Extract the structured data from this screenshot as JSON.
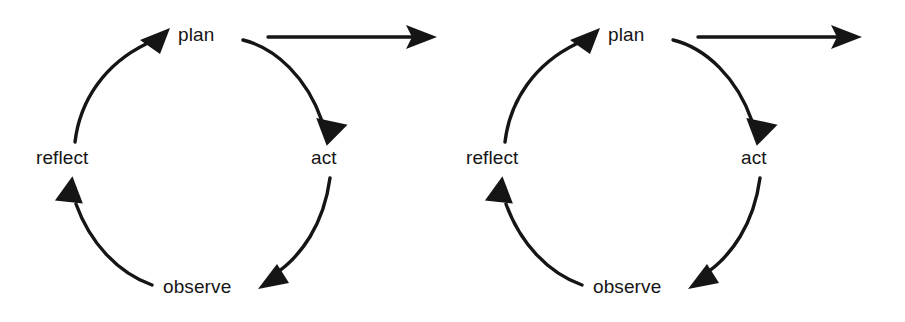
{
  "diagram": {
    "title": "",
    "type": "cycle-diagram",
    "background_color": "#ffffff",
    "stroke_color": "#151515",
    "instances": [
      {
        "id": "cycle-left",
        "nodes": {
          "plan": "plan",
          "act": "act",
          "observe": "observe",
          "reflect": "reflect"
        },
        "edges": [
          {
            "from": "plan",
            "to": "act",
            "style": "curved-arrow",
            "direction": "clockwise"
          },
          {
            "from": "act",
            "to": "observe",
            "style": "curved-arrow",
            "direction": "clockwise"
          },
          {
            "from": "observe",
            "to": "reflect",
            "style": "curved-arrow",
            "direction": "clockwise"
          },
          {
            "from": "reflect",
            "to": "plan",
            "style": "curved-arrow",
            "direction": "clockwise"
          },
          {
            "from": "plan",
            "to": "",
            "style": "straight-arrow",
            "direction": "right"
          }
        ]
      },
      {
        "id": "cycle-right",
        "nodes": {
          "plan": "plan",
          "act": "act",
          "observe": "observe",
          "reflect": "reflect"
        },
        "edges": [
          {
            "from": "plan",
            "to": "act",
            "style": "curved-arrow",
            "direction": "clockwise"
          },
          {
            "from": "act",
            "to": "observe",
            "style": "curved-arrow",
            "direction": "clockwise"
          },
          {
            "from": "observe",
            "to": "reflect",
            "style": "curved-arrow",
            "direction": "clockwise"
          },
          {
            "from": "reflect",
            "to": "plan",
            "style": "curved-arrow",
            "direction": "clockwise"
          },
          {
            "from": "plan",
            "to": "",
            "style": "straight-arrow",
            "direction": "right"
          }
        ]
      }
    ]
  }
}
